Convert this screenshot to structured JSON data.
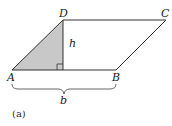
{
  "figure": {
    "caption": "(a)",
    "shape": "parallelogram",
    "vertices": {
      "A": {
        "label": "A",
        "x": 12,
        "y": 70
      },
      "B": {
        "label": "B",
        "x": 116,
        "y": 70
      },
      "C": {
        "label": "C",
        "x": 166,
        "y": 20
      },
      "D": {
        "label": "D",
        "x": 63,
        "y": 20
      }
    },
    "height_label": "h",
    "base_label": "b",
    "shaded_region": "triangle A-D-foot",
    "colors": {
      "stroke": "#333333",
      "shade": "#c8c8c8",
      "background": "#ffffff"
    }
  }
}
